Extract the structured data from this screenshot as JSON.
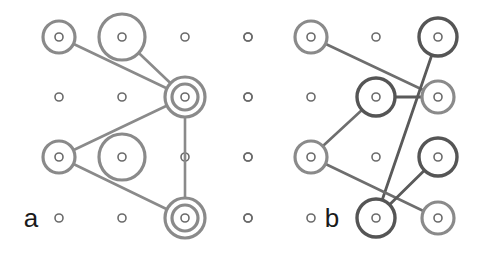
{
  "figure": {
    "background_color": "#ffffff",
    "width": 481,
    "height": 256,
    "grid": {
      "columns_x": [
        59,
        122,
        185,
        248,
        311,
        376,
        438
      ],
      "rows_y": [
        37,
        97,
        157,
        218
      ],
      "dot_radius": 4,
      "dot_stroke_width": 1.6,
      "dot_color": "#6b6b6b"
    },
    "colors": {
      "light_gray": "#8a8a8a",
      "dark_gray": "#555555",
      "dot_gray": "#6b6b6b",
      "label_black": "#1a1a1a",
      "edge_light": "#8a8a8a",
      "edge_dark": "#5a5a5a"
    },
    "panels": [
      {
        "id": "panel-a",
        "label": "a",
        "label_x": 31,
        "label_y": 227,
        "nodes": [
          {
            "name": "a-n1",
            "cx": 59,
            "cy": 37,
            "r": 16,
            "color": "#8a8a8a",
            "stroke_width": 3.2,
            "style": "single"
          },
          {
            "name": "a-n2",
            "cx": 122,
            "cy": 37,
            "r": 23,
            "color": "#8a8a8a",
            "stroke_width": 3.2,
            "style": "single"
          },
          {
            "name": "a-n3",
            "cx": 185,
            "cy": 97,
            "r": 20,
            "color": "#8a8a8a",
            "stroke_width": 3.2,
            "style": "double",
            "inner_r": 13
          },
          {
            "name": "a-n4",
            "cx": 59,
            "cy": 157,
            "r": 16,
            "color": "#8a8a8a",
            "stroke_width": 3.2,
            "style": "single"
          },
          {
            "name": "a-n5",
            "cx": 122,
            "cy": 157,
            "r": 23,
            "color": "#8a8a8a",
            "stroke_width": 3.2,
            "style": "single"
          },
          {
            "name": "a-n6",
            "cx": 185,
            "cy": 218,
            "r": 20,
            "color": "#8a8a8a",
            "stroke_width": 3.2,
            "style": "double",
            "inner_r": 13
          }
        ],
        "plain_dots": [
          {
            "cx": 185,
            "cy": 37
          },
          {
            "cx": 248,
            "cy": 37
          },
          {
            "cx": 59,
            "cy": 97
          },
          {
            "cx": 122,
            "cy": 97
          },
          {
            "cx": 248,
            "cy": 97
          },
          {
            "cx": 185,
            "cy": 157
          },
          {
            "cx": 248,
            "cy": 157
          },
          {
            "cx": 59,
            "cy": 218
          },
          {
            "cx": 122,
            "cy": 218
          },
          {
            "cx": 248,
            "cy": 218
          }
        ],
        "edges": [
          {
            "name": "a-e1",
            "x1": 59,
            "y1": 37,
            "x2": 185,
            "y2": 97,
            "color": "#8a8a8a",
            "width": 2.6
          },
          {
            "name": "a-e2",
            "x1": 122,
            "y1": 37,
            "x2": 185,
            "y2": 97,
            "color": "#8a8a8a",
            "width": 2.6
          },
          {
            "name": "a-e3",
            "x1": 185,
            "y1": 97,
            "x2": 59,
            "y2": 157,
            "color": "#8a8a8a",
            "width": 2.6
          },
          {
            "name": "a-e4",
            "x1": 185,
            "y1": 97,
            "x2": 185,
            "y2": 218,
            "color": "#8a8a8a",
            "width": 2.6
          },
          {
            "name": "a-e5",
            "x1": 59,
            "y1": 157,
            "x2": 185,
            "y2": 218,
            "color": "#8a8a8a",
            "width": 2.6
          }
        ]
      },
      {
        "id": "panel-b",
        "label": "b",
        "label_x": 332,
        "label_y": 227,
        "nodes": [
          {
            "name": "b-n1",
            "cx": 311,
            "cy": 37,
            "r": 16,
            "color": "#8a8a8a",
            "stroke_width": 3.2,
            "style": "single"
          },
          {
            "name": "b-n2",
            "cx": 438,
            "cy": 37,
            "r": 19,
            "color": "#555555",
            "stroke_width": 3.4,
            "style": "single"
          },
          {
            "name": "b-n3",
            "cx": 376,
            "cy": 97,
            "r": 19,
            "color": "#555555",
            "stroke_width": 3.4,
            "style": "single"
          },
          {
            "name": "b-n4",
            "cx": 438,
            "cy": 97,
            "r": 16,
            "color": "#8a8a8a",
            "stroke_width": 3.2,
            "style": "single"
          },
          {
            "name": "b-n5",
            "cx": 311,
            "cy": 157,
            "r": 16,
            "color": "#8a8a8a",
            "stroke_width": 3.2,
            "style": "single"
          },
          {
            "name": "b-n6",
            "cx": 438,
            "cy": 157,
            "r": 19,
            "color": "#555555",
            "stroke_width": 3.4,
            "style": "single"
          },
          {
            "name": "b-n7",
            "cx": 376,
            "cy": 218,
            "r": 19,
            "color": "#555555",
            "stroke_width": 3.4,
            "style": "single"
          },
          {
            "name": "b-n8",
            "cx": 438,
            "cy": 218,
            "r": 16,
            "color": "#8a8a8a",
            "stroke_width": 3.2,
            "style": "single"
          }
        ],
        "plain_dots": [
          {
            "cx": 248,
            "cy": 37
          },
          {
            "cx": 376,
            "cy": 37
          },
          {
            "cx": 248,
            "cy": 97
          },
          {
            "cx": 311,
            "cy": 97
          },
          {
            "cx": 248,
            "cy": 157
          },
          {
            "cx": 376,
            "cy": 157
          },
          {
            "cx": 248,
            "cy": 218
          },
          {
            "cx": 311,
            "cy": 218
          }
        ],
        "edges": [
          {
            "name": "b-e1",
            "x1": 311,
            "y1": 37,
            "x2": 438,
            "y2": 97,
            "color": "#6e6e6e",
            "width": 2.6
          },
          {
            "name": "b-e2",
            "x1": 438,
            "y1": 37,
            "x2": 376,
            "y2": 218,
            "color": "#5a5a5a",
            "width": 2.8
          },
          {
            "name": "b-e3",
            "x1": 376,
            "y1": 97,
            "x2": 438,
            "y2": 97,
            "color": "#5a5a5a",
            "width": 2.8
          },
          {
            "name": "b-e4",
            "x1": 376,
            "y1": 97,
            "x2": 311,
            "y2": 157,
            "color": "#6e6e6e",
            "width": 2.6
          },
          {
            "name": "b-e5",
            "x1": 311,
            "y1": 157,
            "x2": 438,
            "y2": 218,
            "color": "#6e6e6e",
            "width": 2.6
          },
          {
            "name": "b-e6",
            "x1": 438,
            "y1": 157,
            "x2": 376,
            "y2": 218,
            "color": "#5a5a5a",
            "width": 2.8
          }
        ]
      }
    ]
  }
}
